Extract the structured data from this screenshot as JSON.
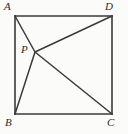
{
  "figure": {
    "background_color": "#fbfbf9",
    "stroke_color": "#3a3a3a",
    "label_color": "#2b2b2b",
    "labels": {
      "a": "A",
      "b": "B",
      "c": "C",
      "d": "D",
      "p": "P"
    },
    "points": {
      "A": {
        "x": 15,
        "y": 16
      },
      "D": {
        "x": 112,
        "y": 16
      },
      "B": {
        "x": 15,
        "y": 114
      },
      "C": {
        "x": 112,
        "y": 114
      },
      "P": {
        "x": 35,
        "y": 52
      }
    },
    "segments": [
      {
        "name": "side-AD",
        "from": "A",
        "to": "D"
      },
      {
        "name": "side-DC",
        "from": "D",
        "to": "C"
      },
      {
        "name": "side-CB",
        "from": "C",
        "to": "B"
      },
      {
        "name": "side-BA",
        "from": "B",
        "to": "A"
      },
      {
        "name": "cevian-PA",
        "from": "P",
        "to": "A"
      },
      {
        "name": "cevian-PB",
        "from": "P",
        "to": "B"
      },
      {
        "name": "cevian-PC",
        "from": "P",
        "to": "C"
      },
      {
        "name": "cevian-PD",
        "from": "P",
        "to": "D"
      }
    ]
  }
}
